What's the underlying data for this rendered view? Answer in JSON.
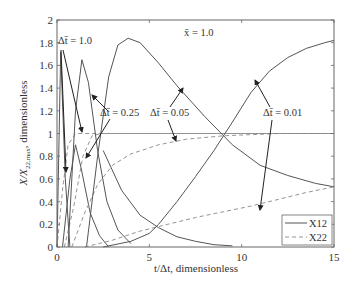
{
  "chart_data": {
    "type": "line",
    "title": "",
    "annotation_top": "x̄ = 1.0",
    "xlabel": "t/Δt, dimensionless",
    "ylabel": "X/X22,max, dimensionless",
    "xlim": [
      0,
      15
    ],
    "ylim": [
      0,
      2
    ],
    "xticks": [
      0,
      5,
      10,
      15
    ],
    "yticks": [
      0,
      0.2,
      0.4,
      0.6,
      0.8,
      1,
      1.2,
      1.4,
      1.6,
      1.8,
      2
    ],
    "ytick_labels": [
      "0",
      "0.2",
      "0.4",
      "0.6",
      "0.8",
      "1",
      "1.2",
      "1.4",
      "1.6",
      "1.8",
      "2"
    ],
    "xtick_labels": [
      "0",
      "5",
      "10",
      "15"
    ],
    "grid": false,
    "legend": {
      "position": "lower right",
      "entries": [
        {
          "label": "X12",
          "style": "solid"
        },
        {
          "label": "X22",
          "style": "dashed"
        }
      ]
    },
    "series": [
      {
        "name": "X12 Δt̄=1.0",
        "style": "solid",
        "x": [
          0,
          0.2,
          0.45,
          0.7
        ],
        "y": [
          0,
          1.72,
          0.6,
          0
        ]
      },
      {
        "name": "X22 Δt̄=1.0",
        "style": "dashed",
        "x": [
          0,
          0.3,
          0.6,
          1.0,
          15
        ],
        "y": [
          0,
          0.5,
          0.9,
          1.0,
          1.0
        ]
      },
      {
        "name": "X12 Δt̄=0.25",
        "style": "solid",
        "x": [
          0.3,
          0.7,
          1.0,
          1.3,
          1.8,
          2.3,
          2.8
        ],
        "y": [
          0,
          0.6,
          0.9,
          0.7,
          0.3,
          0.1,
          0
        ]
      },
      {
        "name": "X22 Δt̄=0.25",
        "style": "dashed",
        "x": [
          0.4,
          0.9,
          1.4,
          1.9,
          2.4,
          15
        ],
        "y": [
          0,
          0.35,
          0.8,
          0.98,
          1.0,
          1.0
        ]
      },
      {
        "name": "X12 Δt̄=0.05 (peak 1.65)",
        "style": "solid",
        "x": [
          0.6,
          1.0,
          1.35,
          1.7,
          2.2,
          2.7,
          3.3,
          4.0
        ],
        "y": [
          0,
          1.2,
          1.65,
          1.45,
          0.85,
          0.4,
          0.15,
          0.03
        ]
      },
      {
        "name": "X22 Δt̄=0.05",
        "style": "dashed",
        "x": [
          0.8,
          1.5,
          2.2,
          3.0,
          4.0,
          5.5,
          7.0,
          9.0,
          12.0,
          15.0
        ],
        "y": [
          0,
          0.3,
          0.55,
          0.72,
          0.82,
          0.9,
          0.95,
          0.98,
          1.0,
          1.0
        ]
      },
      {
        "name": "X12 Δt̄=0.05 (peak 1.84)",
        "style": "solid",
        "x": [
          1.6,
          2.2,
          2.8,
          3.3,
          3.85,
          4.5,
          5.5,
          6.5,
          8.0,
          9.5,
          11.0,
          12.5,
          14.0,
          15.0
        ],
        "y": [
          0,
          0.8,
          1.5,
          1.78,
          1.84,
          1.8,
          1.62,
          1.42,
          1.15,
          0.9,
          0.72,
          0.63,
          0.56,
          0.53
        ]
      },
      {
        "name": "X22 Δt̄=0.01",
        "style": "dashed",
        "x": [
          1.5,
          3.0,
          4.5,
          6.0,
          7.5,
          9.0,
          10.5,
          12.0,
          13.5,
          15.0
        ],
        "y": [
          0,
          0.06,
          0.14,
          0.2,
          0.26,
          0.31,
          0.36,
          0.42,
          0.48,
          0.53
        ]
      },
      {
        "name": "X12 Δt̄=0.01 (decay)",
        "style": "solid",
        "x": [
          2.5,
          3.5,
          4.5,
          5.5,
          6.5,
          7.5,
          8.5,
          9.5
        ],
        "y": [
          0.85,
          0.5,
          0.28,
          0.17,
          0.09,
          0.05,
          0.02,
          0.01
        ]
      },
      {
        "name": "X12 Δt̄=0.01 (rise)",
        "style": "solid",
        "x": [
          2.5,
          4.0,
          5.0,
          5.5,
          6.5,
          7.5,
          8.5,
          9.5,
          10.5,
          11.5,
          12.5,
          13.5,
          14.5,
          15.0
        ],
        "y": [
          0,
          0.05,
          0.12,
          0.2,
          0.4,
          0.62,
          0.85,
          1.1,
          1.36,
          1.55,
          1.67,
          1.75,
          1.8,
          1.82
        ]
      }
    ],
    "annotations": [
      {
        "text": "Δt̄ = 1.0",
        "x": 0.1,
        "y": 1.82
      },
      {
        "text": "Δt̄ = 0.25",
        "x": 2.3,
        "y": 1.2
      },
      {
        "text": "Δt̄ = 0.05",
        "x": 5.2,
        "y": 1.2
      },
      {
        "text": "Δt̄ = 0.01",
        "x": 10.8,
        "y": 1.2
      },
      {
        "text": "x̄ = 1.0",
        "x": 7.8,
        "y": 1.88
      }
    ]
  },
  "labels": {
    "annot_dt1": "Δt̄ = 1.0",
    "annot_dt025": "Δt̄ = 0.25",
    "annot_dt005": "Δt̄ = 0.05",
    "annot_dt001": "Δt̄ = 0.01",
    "annot_x": "x̄ = 1.0",
    "xlabel": "t/Δt, dimensionless",
    "ylabel_main": "X/X",
    "ylabel_sub": "22,max",
    "ylabel_rest": ", dimensionless",
    "legend_x12": "X12",
    "legend_x22": "X22"
  }
}
